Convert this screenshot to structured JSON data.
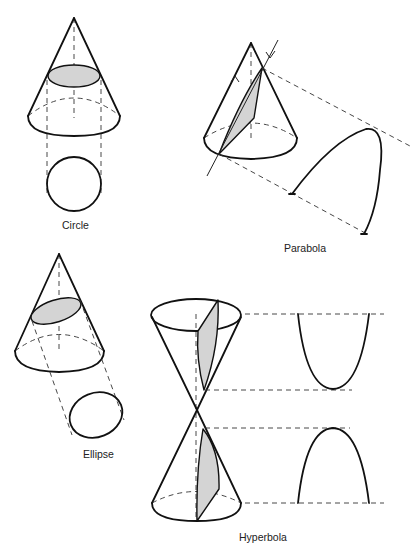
{
  "figure": {
    "colors": {
      "line": "#111111",
      "shade": "#d4d4d4",
      "background": "#ffffff"
    },
    "panels": [
      {
        "id": "circle",
        "label": "Circle"
      },
      {
        "id": "parabola",
        "label": "Parabola"
      },
      {
        "id": "ellipse",
        "label": "Ellipse"
      },
      {
        "id": "hyperbola",
        "label": "Hyperbola"
      }
    ]
  }
}
